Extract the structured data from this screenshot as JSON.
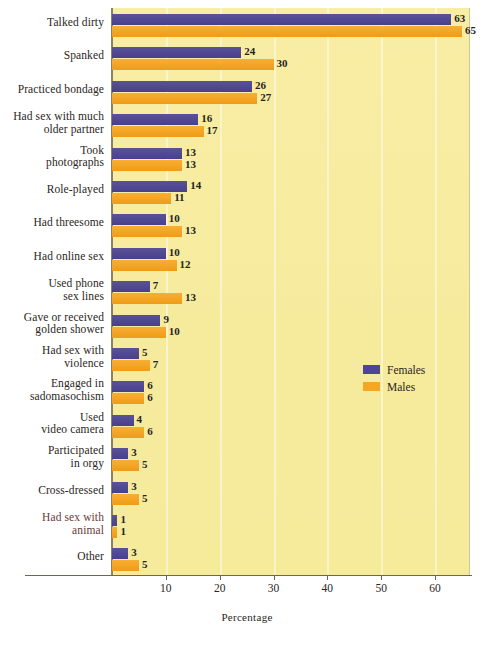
{
  "chart_data": {
    "type": "bar",
    "orientation": "horizontal",
    "title": "",
    "xlabel": "Percentage",
    "ylabel": "",
    "xlim": [
      0,
      66
    ],
    "xticks": [
      10,
      20,
      30,
      40,
      50,
      60
    ],
    "grid": true,
    "legend_position": "middle-right",
    "categories": [
      "Talked dirty",
      "Spanked",
      "Practiced bondage",
      "Had sex with much older partner",
      "Took photographs",
      "Role-played",
      "Had threesome",
      "Had online sex",
      "Used phone sex lines",
      "Gave or received golden shower",
      "Had sex with violence",
      "Engaged in sadomasochism",
      "Used video camera",
      "Participated in orgy",
      "Cross-dressed",
      "Had sex with animal",
      "Other"
    ],
    "category_lines": [
      [
        "Talked dirty"
      ],
      [
        "Spanked"
      ],
      [
        "Practiced bondage"
      ],
      [
        "Had sex with much",
        "older partner"
      ],
      [
        "Took",
        "photographs"
      ],
      [
        "Role-played"
      ],
      [
        "Had threesome"
      ],
      [
        "Had online sex"
      ],
      [
        "Used phone",
        "sex lines"
      ],
      [
        "Gave or received",
        "golden shower"
      ],
      [
        "Had sex with",
        "violence"
      ],
      [
        "Engaged in",
        "sadomasochism"
      ],
      [
        "Used",
        "video camera"
      ],
      [
        "Participated",
        "in orgy"
      ],
      [
        "Cross-dressed"
      ],
      [
        "Had sex with",
        "animal"
      ],
      [
        "Other"
      ]
    ],
    "series": [
      {
        "name": "Females",
        "color": "#4e4694",
        "values": [
          63,
          24,
          26,
          16,
          13,
          14,
          10,
          10,
          7,
          9,
          5,
          6,
          4,
          3,
          3,
          1,
          3
        ]
      },
      {
        "name": "Males",
        "color": "#f5a623",
        "values": [
          65,
          30,
          27,
          17,
          13,
          11,
          13,
          12,
          13,
          10,
          7,
          6,
          6,
          5,
          5,
          1,
          5
        ]
      }
    ]
  },
  "legend": {
    "items": [
      {
        "label": "Females",
        "color": "#4e4694"
      },
      {
        "label": "Males",
        "color": "#f5a623"
      }
    ]
  },
  "axis": {
    "x_title": "Percentage",
    "tick_labels": [
      "10",
      "20",
      "30",
      "40",
      "50",
      "60"
    ]
  },
  "colors": {
    "female": "#4e4694",
    "male": "#f5a623",
    "plot_background": "#f7eca0",
    "page_background": "#ffffff",
    "text": "#2a2622"
  }
}
